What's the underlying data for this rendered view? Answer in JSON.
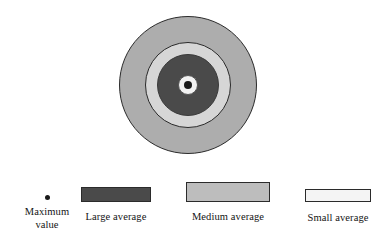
{
  "figure": {
    "type": "concentric-ring-diagram",
    "title": "",
    "background_color": "#FFFFFF"
  },
  "chart_data": {
    "type": "pie",
    "title": "",
    "subtitle": "",
    "xlabel": "",
    "ylabel": "",
    "legend_position": "bottom",
    "grid": false,
    "center": {
      "x": 188,
      "y": 85
    },
    "categories": [
      "Small average",
      "Medium average",
      "Large average",
      "Maximum value"
    ],
    "series": [
      {
        "name": "ring radius (px)",
        "values": [
          69,
          43,
          31,
          4
        ]
      }
    ],
    "rings": [
      {
        "name": "Medium average",
        "role": "outer-ring",
        "fill": "#ADADAD",
        "stroke": "#2B2B2B",
        "radius_px": 69,
        "order": 1
      },
      {
        "name": "Small average",
        "role": "second-ring",
        "fill": "#D6D6D6",
        "stroke": "#2B2B2B",
        "radius_px": 43,
        "order": 2
      },
      {
        "name": "Large average",
        "role": "third-ring",
        "fill": "#4A4A4A",
        "stroke": "#3A3A3A",
        "radius_px": 31,
        "order": 3
      },
      {
        "name": "Small average",
        "role": "core-ring",
        "fill": "#F2F2F2",
        "stroke": "#555555",
        "radius_px": 10,
        "order": 4
      },
      {
        "name": "Maximum value",
        "role": "center-dot",
        "fill": "#1A1A1A",
        "stroke": "#1A1A1A",
        "radius_px": 4,
        "order": 5
      }
    ]
  },
  "legend": {
    "entries": [
      {
        "id": "maximum-value",
        "label": "Maximum\nvalue",
        "swatch_shape": "dot",
        "fill": "#1A1A1A",
        "stroke": "#1A1A1A"
      },
      {
        "id": "large-average",
        "label": "Large average",
        "swatch_shape": "bar",
        "fill": "#4A4A4A",
        "stroke": "#2B2B2B"
      },
      {
        "id": "medium-average",
        "label": "Medium average",
        "swatch_shape": "bar",
        "fill": "#BDBDBD",
        "stroke": "#2B2B2B"
      },
      {
        "id": "small-average",
        "label": "Small average",
        "swatch_shape": "bar",
        "fill": "#F4F4F4",
        "stroke": "#2B2B2B"
      }
    ]
  }
}
